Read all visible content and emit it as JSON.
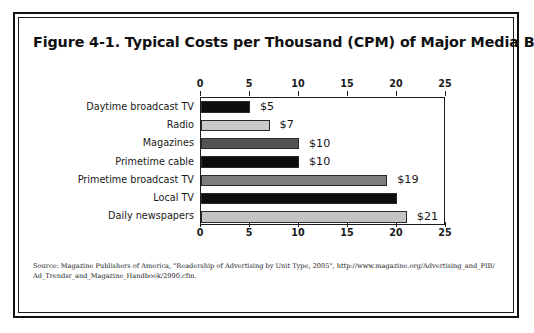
{
  "figure": {
    "title": "Figure 4-1. Typical Costs per Thousand (CPM) of Major Media Buys",
    "source_line_1": "Source: Magazine Publishers of America, \"Readership of Advertising by Unit Type, 2005\", http://www.magazine.org/Advertising_and_PIB/",
    "source_line_2": "Ad_Trendsr_and_Magazine_Handbook/2990.cfm."
  },
  "chart_data": {
    "type": "bar",
    "orientation": "horizontal",
    "title": "Figure 4-1. Typical Costs per Thousand (CPM) of Major Media Buys",
    "xlabel": "",
    "ylabel": "",
    "xlim": [
      0,
      25
    ],
    "xticks": [
      0,
      5,
      10,
      15,
      20,
      25
    ],
    "xtick_labels": [
      "0",
      "5",
      "10",
      "15",
      "20",
      "25"
    ],
    "axis_positions": [
      "top",
      "bottom"
    ],
    "grid": false,
    "legend": "none",
    "categories": [
      "Daytime broadcast TV",
      "Radio",
      "Magazines",
      "Primetime cable",
      "Primetime broadcast TV",
      "Local TV",
      "Daily newspapers"
    ],
    "values": [
      5,
      7,
      10,
      10,
      19,
      20,
      21
    ],
    "data_labels": [
      "$5",
      "$7",
      "$10",
      "$10",
      "$19",
      "",
      "$21"
    ],
    "bar_colors": [
      "#0d0d0d",
      "#c8c8c8",
      "#545454",
      "#0d0d0d",
      "#7d7d7d",
      "#0d0d0d",
      "#c3c3c3"
    ]
  }
}
